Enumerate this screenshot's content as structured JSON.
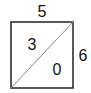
{
  "diagram": {
    "top_label": "5",
    "right_label": "6",
    "upper_left_triangle_value": "3",
    "lower_right_triangle_value": "0",
    "colors": {
      "square_stroke": "#222222",
      "diagonal_stroke": "#888888"
    }
  }
}
